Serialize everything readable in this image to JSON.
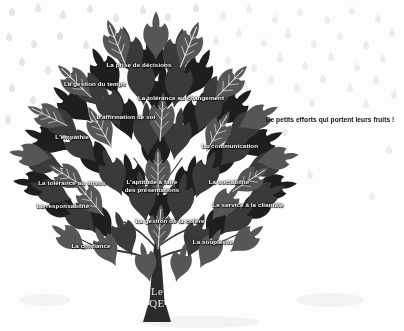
{
  "poster": {
    "title": "Le QE",
    "trunk_label_line1": "Le",
    "trunk_label_line2": "QE",
    "tagline": "De petits efforts qui portent leurs fruits !",
    "background_color": "#ffffff",
    "ink_color": "#1d1d1d",
    "label_color": "#ffffff",
    "raindrop_color": "#e8e8e8"
  },
  "skills": [
    {
      "id": "prise-de-decisions",
      "text": "La prise de décisions",
      "x": 139,
      "y": 65,
      "lines": 1
    },
    {
      "id": "gestion-du-temps",
      "text": "La gestion du temps",
      "x": 95,
      "y": 84,
      "lines": 1
    },
    {
      "id": "tolerance-au-changement",
      "text": "La tolérance au changement",
      "x": 181,
      "y": 98,
      "lines": 1
    },
    {
      "id": "affirmation-de-soi",
      "text": "L'affirmation de soi",
      "x": 126,
      "y": 117,
      "lines": 1
    },
    {
      "id": "empathie",
      "text": "L'empathie",
      "x": 72,
      "y": 137,
      "lines": 1
    },
    {
      "id": "communication",
      "text": "La communication",
      "x": 230,
      "y": 146,
      "lines": 1
    },
    {
      "id": "tolerance-au-stress",
      "text": "La tolérance au stress",
      "x": 72,
      "y": 183,
      "lines": 1
    },
    {
      "id": "aptitude-presentations",
      "text": "L'aptitude à faire\ndes présentations",
      "x": 152,
      "y": 186,
      "lines": 2
    },
    {
      "id": "sociabilite",
      "text": "La sociabilité",
      "x": 229,
      "y": 182,
      "lines": 1
    },
    {
      "id": "responsabilite",
      "text": "La responsabilité",
      "x": 63,
      "y": 206,
      "lines": 1
    },
    {
      "id": "service-a-la-clientele",
      "text": "Le service à la clientèle",
      "x": 248,
      "y": 205,
      "lines": 1
    },
    {
      "id": "gestion-de-la-colere",
      "text": "La gestion de la colère",
      "x": 170,
      "y": 221,
      "lines": 1
    },
    {
      "id": "souplesse",
      "text": "La souplesse",
      "x": 213,
      "y": 242,
      "lines": 1
    },
    {
      "id": "confiance",
      "text": "La confiance",
      "x": 91,
      "y": 246,
      "lines": 1
    }
  ],
  "tagline_position": {
    "x": 330,
    "y": 119
  },
  "trunk_position": {
    "x": 157,
    "y": 298
  }
}
